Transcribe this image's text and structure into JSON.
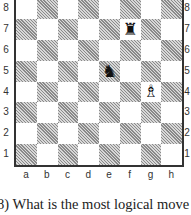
{
  "diagram": {
    "type": "chess-board",
    "files": [
      "a",
      "b",
      "c",
      "d",
      "e",
      "f",
      "g",
      "h"
    ],
    "ranks": [
      "8",
      "7",
      "6",
      "5",
      "4",
      "3",
      "2",
      "1"
    ],
    "pieces": [
      {
        "square": "f7",
        "piece": "rook",
        "color": "black",
        "glyph": "♜"
      },
      {
        "square": "e5",
        "piece": "knight",
        "color": "black",
        "glyph": "♞"
      },
      {
        "square": "g4",
        "piece": "bishop",
        "color": "white",
        "glyph": "♗"
      }
    ],
    "colors": {
      "dark_square": "#bdbdbd",
      "light_square": "#ffffff",
      "border": "#333333"
    }
  },
  "caption": {
    "text": "8) What is the most logical move fo"
  }
}
